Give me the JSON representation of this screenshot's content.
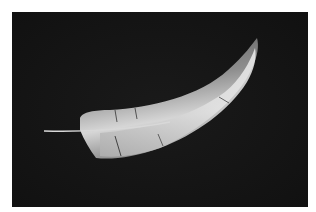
{
  "image": {
    "subject": "feather",
    "description": "A single curved white-grey feather on a dark black background",
    "background_color": "#151515",
    "border_color": "#ffffff",
    "feather_colors": {
      "highlight": "#e6e6e6",
      "mid": "#a8a8a8",
      "shadow": "#5a5a5a",
      "quill": "#d8d8d8"
    }
  }
}
